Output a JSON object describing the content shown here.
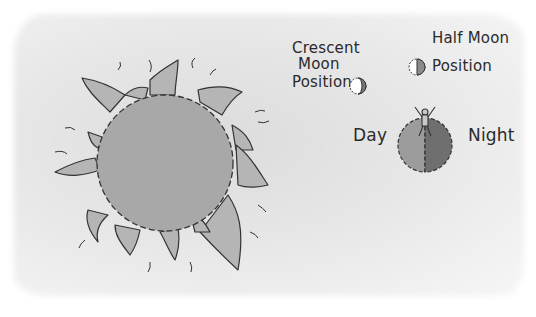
{
  "illustration": {
    "sun": {
      "label": "sun",
      "fill": "#a9a9a9",
      "petal_fill": "#b3b3b3"
    },
    "crescent_moon": {
      "label_line1": "Crescent",
      "label_line2": "Moon",
      "label_line3": "Position"
    },
    "half_moon": {
      "label_line1": "Half Moon",
      "label_line2": "Position"
    },
    "earth": {
      "day_label": "Day",
      "night_label": "Night",
      "day_fill": "#9c9c9c",
      "night_fill": "#6f6f6f"
    }
  }
}
